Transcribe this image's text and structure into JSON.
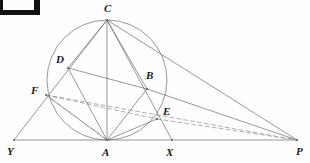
{
  "figure": {
    "type": "euclidean-geometry-diagram",
    "background_color": "#fefefe",
    "stroke_color": "#6b6b6b",
    "label_color": "#1a1a1a",
    "width": 310,
    "height": 163,
    "corner_mark": {
      "name": "black-corner-bracket",
      "color": "#111111",
      "x": 0,
      "y": 0,
      "width": 40,
      "height": 15
    },
    "circle": {
      "cx": 107,
      "cy": 80,
      "r": 60,
      "style": "solid"
    },
    "points": [
      {
        "id": "C",
        "label": "C",
        "x": 107,
        "y": 20,
        "label_x": 104,
        "label_y": 3
      },
      {
        "id": "D",
        "label": "D",
        "x": 68,
        "y": 68,
        "label_x": 56,
        "label_y": 54
      },
      {
        "id": "B",
        "label": "B",
        "x": 147,
        "y": 89,
        "label_x": 146,
        "label_y": 70
      },
      {
        "id": "F",
        "label": "F",
        "x": 46,
        "y": 95,
        "label_x": 31,
        "label_y": 85
      },
      {
        "id": "E",
        "label": "E",
        "x": 157,
        "y": 119,
        "label_x": 163,
        "label_y": 106
      },
      {
        "id": "Y",
        "label": "Y",
        "x": 14,
        "y": 140,
        "label_x": 7,
        "label_y": 146
      },
      {
        "id": "A",
        "label": "A",
        "x": 107,
        "y": 140,
        "label_x": 102,
        "label_y": 147
      },
      {
        "id": "X",
        "label": "X",
        "x": 172,
        "y": 140,
        "label_x": 166,
        "label_y": 147
      },
      {
        "id": "P",
        "label": "P",
        "x": 297,
        "y": 140,
        "label_x": 296,
        "label_y": 146
      }
    ],
    "solid_segments": [
      {
        "name": "baseline-Y-P",
        "from": "Y",
        "to": "P"
      },
      {
        "name": "segment-Y-C",
        "from": "Y",
        "to": "C"
      },
      {
        "name": "segment-C-P",
        "from": "C",
        "to": "P"
      },
      {
        "name": "segment-C-A",
        "from": "C",
        "to": "A"
      },
      {
        "name": "segment-C-D",
        "from": "C",
        "to": "D"
      },
      {
        "name": "segment-C-B",
        "from": "C",
        "to": "B"
      },
      {
        "name": "segment-D-B",
        "from": "D",
        "to": "B"
      },
      {
        "name": "segment-D-A",
        "from": "D",
        "to": "A"
      },
      {
        "name": "segment-B-A",
        "from": "B",
        "to": "A"
      },
      {
        "name": "segment-F-A",
        "from": "F",
        "to": "A"
      },
      {
        "name": "segment-E-A",
        "from": "E",
        "to": "A"
      },
      {
        "name": "segment-B-P",
        "from": "B",
        "to": "P"
      },
      {
        "name": "segment-C-X",
        "from": "C",
        "to": "X"
      }
    ],
    "dashed_segments": [
      {
        "name": "dashed-F-E",
        "from": "F",
        "to": "E"
      },
      {
        "name": "dashed-E-P",
        "from": "E",
        "to": "P"
      },
      {
        "name": "dashed-F-A",
        "from": "F",
        "to": "A"
      },
      {
        "name": "dashed-F-P",
        "from": "F",
        "to": "P"
      }
    ]
  }
}
